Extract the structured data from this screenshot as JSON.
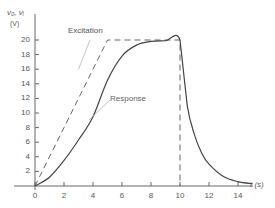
{
  "chart_data": {
    "type": "line",
    "title": "",
    "xlabel": "t (s)",
    "ylabel": "vo, vi (V)",
    "ylabel_line1": "v₀, vᵢ",
    "ylabel_line2": "(V)",
    "xlim": [
      0,
      15
    ],
    "ylim": [
      0,
      22
    ],
    "grid": false,
    "x_ticks": [
      0,
      2,
      4,
      6,
      8,
      10,
      12,
      14
    ],
    "y_ticks": [
      2,
      4,
      6,
      8,
      10,
      12,
      14,
      16,
      18,
      20
    ],
    "series": [
      {
        "name": "Excitation",
        "style": "dashed",
        "x": [
          0,
          5,
          10,
          10
        ],
        "y": [
          0,
          20,
          20,
          0
        ]
      },
      {
        "name": "Response",
        "style": "solid",
        "x": [
          0,
          1,
          2,
          3,
          4,
          5,
          6,
          7,
          8,
          9,
          10,
          10.5,
          11,
          11.5,
          12,
          13,
          14,
          15
        ],
        "y": [
          0,
          1.2,
          3.5,
          6.3,
          9.5,
          14.5,
          17.8,
          19.3,
          19.8,
          19.9,
          20,
          11,
          7,
          4.5,
          3,
          1.3,
          0.6,
          0.3
        ]
      }
    ],
    "annotations": [
      {
        "text": "Excitation",
        "points_to": "Excitation",
        "at": [
          3.0,
          16
        ]
      },
      {
        "text": "Response",
        "points_to": "Response",
        "at": [
          3.7,
          9.0
        ]
      }
    ]
  }
}
